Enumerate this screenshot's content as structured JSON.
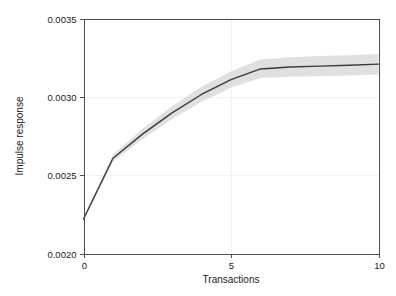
{
  "chart_data": {
    "type": "line",
    "title": "",
    "subtitle": "",
    "xlabel": "Transactions",
    "ylabel": "Impulse response",
    "xlim": [
      0,
      10
    ],
    "ylim": [
      0.002,
      0.0035
    ],
    "xticks": [
      0,
      5,
      10
    ],
    "xtick_labels": [
      "0",
      "5",
      "10"
    ],
    "yticks": [
      0.002,
      0.0025,
      0.003,
      0.0035
    ],
    "ytick_labels": [
      "0.0020",
      "0.0025",
      "0.0030",
      "0.0035"
    ],
    "grid": true,
    "legend": "none",
    "x": [
      0,
      1,
      2,
      3,
      4,
      5,
      6,
      7,
      8,
      9,
      10
    ],
    "series": [
      {
        "name": "Impulse response",
        "kind": "line",
        "color": "#3a3a3a",
        "values": [
          0.00222,
          0.002608,
          0.002762,
          0.002898,
          0.003015,
          0.00311,
          0.003178,
          0.00319,
          0.003196,
          0.003202,
          0.003209
        ]
      },
      {
        "name": "Confidence band lower",
        "kind": "band-lower",
        "color": "#d4d4d4",
        "values": [
          0.002208,
          0.002588,
          0.00273,
          0.002858,
          0.002968,
          0.003058,
          0.00312,
          0.003128,
          0.003132,
          0.003136,
          0.003142
        ]
      },
      {
        "name": "Confidence band upper",
        "kind": "band-upper",
        "color": "#d4d4d4",
        "values": [
          0.002232,
          0.00263,
          0.002796,
          0.00294,
          0.003064,
          0.003164,
          0.003238,
          0.003252,
          0.00326,
          0.003266,
          0.003274
        ]
      }
    ],
    "annotations": []
  },
  "figure": {
    "background": "#ffffff",
    "axis_color": "#4d4d4d",
    "grid_color": "#f2f2f2",
    "text_color": "#1a1a1a"
  }
}
